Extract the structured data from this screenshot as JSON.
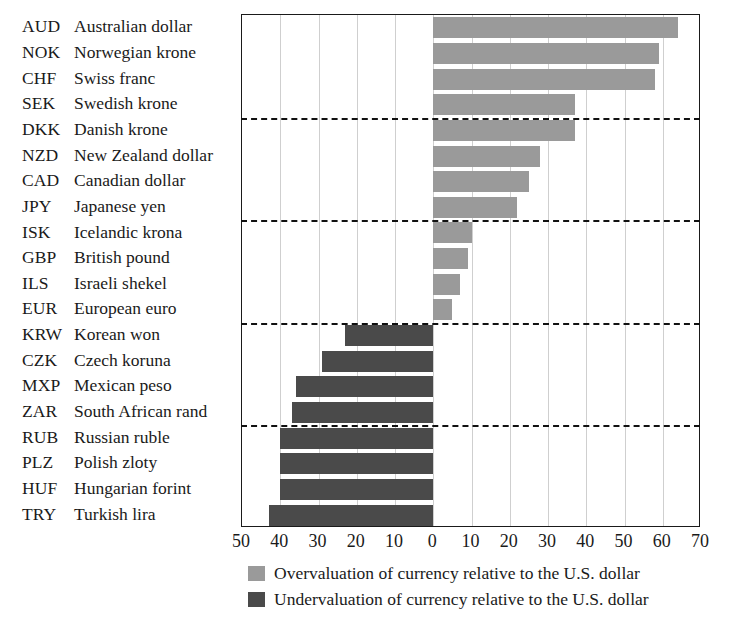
{
  "chart_data": {
    "type": "bar",
    "orientation": "horizontal",
    "title": "",
    "subtitle": "",
    "xlabel": "",
    "ylabel": "",
    "xlim": [
      -50,
      70
    ],
    "axis_tick_labels": [
      "50",
      "40",
      "30",
      "20",
      "10",
      "0",
      "10",
      "20",
      "30",
      "40",
      "50",
      "60",
      "70"
    ],
    "axis_tick_values": [
      -50,
      -40,
      -30,
      -20,
      -10,
      0,
      10,
      20,
      30,
      40,
      50,
      60,
      70
    ],
    "grid": true,
    "legend_position": "bottom",
    "group_separators_after": [
      4,
      8,
      12,
      16
    ],
    "categories": [
      "AUD Australian dollar",
      "NOK Norwegian krone",
      "CHF Swiss franc",
      "SEK Swedish krone",
      "DKK Danish krone",
      "NZD New Zealand dollar",
      "CAD Canadian dollar",
      "JPY Japanese yen",
      "ISK Icelandic krona",
      "GBP British pound",
      "ILS Israeli shekel",
      "EUR European euro",
      "KRW Korean won",
      "CZK Czech koruna",
      "MXP Mexican peso",
      "ZAR South African rand",
      "RUB Russian ruble",
      "PLZ Polish zloty",
      "HUF Hungarian forint",
      "TRY Turkish lira"
    ],
    "values": [
      64,
      59,
      58,
      37,
      37,
      28,
      25,
      22,
      10,
      9,
      7,
      5,
      -23,
      -29,
      -36,
      -37,
      -40,
      -40,
      -40,
      -43
    ]
  },
  "rows": [
    {
      "code": "AUD",
      "name": "Australian dollar",
      "value": 64
    },
    {
      "code": "NOK",
      "name": "Norwegian krone",
      "value": 59
    },
    {
      "code": "CHF",
      "name": "Swiss franc",
      "value": 58
    },
    {
      "code": "SEK",
      "name": "Swedish krone",
      "value": 37
    },
    {
      "code": "DKK",
      "name": "Danish krone",
      "value": 37
    },
    {
      "code": "NZD",
      "name": "New Zealand dollar",
      "value": 28
    },
    {
      "code": "CAD",
      "name": "Canadian dollar",
      "value": 25
    },
    {
      "code": "JPY",
      "name": "Japanese yen",
      "value": 22
    },
    {
      "code": "ISK",
      "name": "Icelandic krona",
      "value": 10
    },
    {
      "code": "GBP",
      "name": "British pound",
      "value": 9
    },
    {
      "code": "ILS",
      "name": "Israeli shekel",
      "value": 7
    },
    {
      "code": "EUR",
      "name": "European euro",
      "value": 5
    },
    {
      "code": "KRW",
      "name": "Korean won",
      "value": -23
    },
    {
      "code": "CZK",
      "name": "Czech koruna",
      "value": -29
    },
    {
      "code": "MXP",
      "name": "Mexican peso",
      "value": -36
    },
    {
      "code": "ZAR",
      "name": "South African rand",
      "value": -37
    },
    {
      "code": "RUB",
      "name": "Russian ruble",
      "value": -40
    },
    {
      "code": "PLZ",
      "name": "Polish zloty",
      "value": -40
    },
    {
      "code": "HUF",
      "name": "Hungarian forint",
      "value": -40
    },
    {
      "code": "TRY",
      "name": "Turkish lira",
      "value": -43
    }
  ],
  "legend": {
    "items": [
      {
        "swatch": "pos",
        "label": "Overvaluation of currency relative to the U.S. dollar"
      },
      {
        "swatch": "neg",
        "label": "Undervaluation of currency relative to the U.S. dollar"
      }
    ]
  },
  "colors": {
    "overvalued_bar": "#9a9a9a",
    "undervalued_bar": "#4a4a4a",
    "axis": "#1a1a1a",
    "gridline": "#cfcfcf",
    "separator": "#111111",
    "background": "#ffffff"
  }
}
